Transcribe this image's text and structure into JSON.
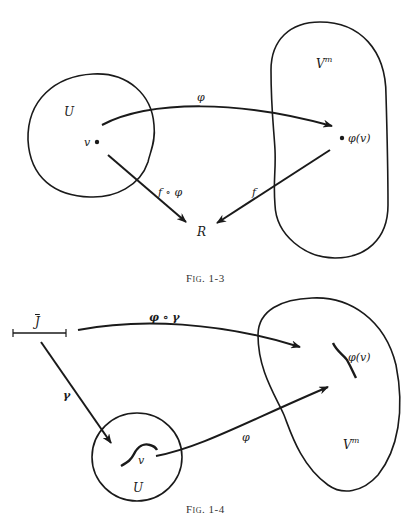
{
  "figures": [
    {
      "caption": "Fig. 1-3",
      "labels": {
        "domain": "U",
        "point": "v",
        "target_space": "V",
        "target_space_sup": "m",
        "image_point": "φ(v)",
        "map_phi": "φ",
        "map_f": "f",
        "composite": "f ∘ φ",
        "reals": "R"
      }
    },
    {
      "caption": "Fig. 1-4",
      "labels": {
        "interval": "J",
        "composite": "φ ∘ γ",
        "map_gamma": "γ",
        "map_phi": "φ",
        "point": "v",
        "domain": "U",
        "target_space": "V",
        "target_space_sup": "m",
        "image_point": "φ(v)"
      }
    }
  ]
}
